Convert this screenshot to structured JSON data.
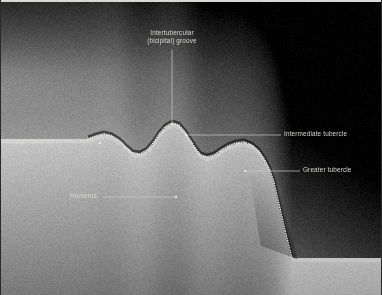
{
  "figure": {
    "modality": "ultrasound",
    "region": "shoulder / proximal humerus transverse view",
    "background_color": "#000000",
    "frame_color": "#d8d8d4",
    "label_color": "#d6d6d2",
    "leader_color": "#c9c9c5",
    "contour_color": "#efefe8"
  },
  "labels": {
    "groove_line1": "Intertubercular",
    "groove_line2": "(bicipital) groove",
    "intermediate": "Intermediate tubercle",
    "greater": "Greater tubercle",
    "lesser": "Lesser tubercle",
    "humerus": "Humerus"
  },
  "annotations": [
    {
      "name": "intertubercular-groove",
      "text": "Intertubercular (bicipital) groove",
      "label_x": 172,
      "label_y": 38,
      "leader": [
        [
          172,
          50
        ],
        [
          172,
          122
        ]
      ],
      "marker": [
        172,
        124
      ]
    },
    {
      "name": "intermediate-tubercle",
      "text": "Intermediate tubercle",
      "label_x": 284,
      "label_y": 134,
      "leader": [
        [
          281,
          135
        ],
        [
          186,
          135
        ]
      ],
      "marker": [
        186,
        135
      ]
    },
    {
      "name": "greater-tubercle",
      "text": "Greater tubercle",
      "label_x": 303,
      "label_y": 170,
      "leader": [
        [
          300,
          171
        ],
        [
          245,
          171
        ]
      ],
      "marker": [
        245,
        171
      ]
    },
    {
      "name": "lesser-tubercle",
      "text": "Lesser tubercle",
      "label_x": 8,
      "label_y": 142,
      "leader": [
        [
          64,
          143
        ],
        [
          100,
          143
        ]
      ],
      "marker": [
        100,
        143
      ]
    },
    {
      "name": "humerus",
      "text": "Humerus",
      "label_x": 70,
      "label_y": 196,
      "leader": [
        [
          103,
          197
        ],
        [
          176,
          197
        ]
      ],
      "marker": [
        176,
        197
      ]
    }
  ],
  "scan_field": {
    "shape": "trapezoid",
    "corners": [
      [
        62,
        40
      ],
      [
        278,
        40
      ],
      [
        321,
        268
      ],
      [
        62,
        172
      ]
    ],
    "top_left": [
      62,
      40
    ],
    "top_right": [
      278,
      40
    ],
    "bottom_right_apex": [
      321,
      268
    ],
    "bottom_left": [
      62,
      172
    ]
  },
  "bone_contour": {
    "type": "dotted",
    "description": "hyperechoic cortical outline of lesser tubercle, intertubercular groove, intermediate and greater tubercles",
    "points": [
      [
        88,
        139
      ],
      [
        96,
        136
      ],
      [
        104,
        134
      ],
      [
        112,
        136
      ],
      [
        120,
        141
      ],
      [
        127,
        148
      ],
      [
        133,
        153
      ],
      [
        140,
        154
      ],
      [
        147,
        150
      ],
      [
        153,
        143
      ],
      [
        159,
        134
      ],
      [
        165,
        127
      ],
      [
        172,
        123
      ],
      [
        179,
        125
      ],
      [
        185,
        132
      ],
      [
        191,
        141
      ],
      [
        196,
        149
      ],
      [
        201,
        155
      ],
      [
        207,
        157
      ],
      [
        214,
        155
      ],
      [
        221,
        150
      ],
      [
        228,
        146
      ],
      [
        236,
        143
      ],
      [
        244,
        142
      ],
      [
        252,
        145
      ],
      [
        259,
        151
      ],
      [
        265,
        160
      ],
      [
        270,
        170
      ],
      [
        274,
        182
      ],
      [
        277,
        195
      ],
      [
        280,
        208
      ],
      [
        283,
        221
      ],
      [
        286,
        234
      ],
      [
        289,
        246
      ],
      [
        292,
        258
      ]
    ]
  }
}
